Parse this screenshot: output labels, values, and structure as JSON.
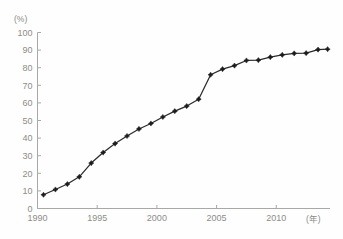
{
  "chart_data": {
    "type": "line",
    "title": "",
    "subtitle": "",
    "xlabel": "(年)",
    "ylabel": "(%)",
    "xlim": [
      1990,
      2014.5
    ],
    "ylim": [
      0,
      100
    ],
    "grid": false,
    "legend": "none",
    "x_tick_labels": [
      "1990",
      "1995",
      "2000",
      "2005",
      "2010"
    ],
    "x_tick_values": [
      1990,
      1995,
      2000,
      2005,
      2010
    ],
    "y_tick_labels": [
      "0",
      "10",
      "20",
      "30",
      "40",
      "50",
      "60",
      "70",
      "80",
      "90",
      "100"
    ],
    "y_tick_values": [
      0,
      10,
      20,
      30,
      40,
      50,
      60,
      70,
      80,
      90,
      100
    ],
    "x": [
      1990.5,
      1991.5,
      1992.5,
      1993.5,
      1994.5,
      1995.5,
      1996.5,
      1997.5,
      1998.5,
      1999.5,
      2000.5,
      2001.5,
      2002.5,
      2003.5,
      2004.5,
      2005.5,
      2006.5,
      2007.5,
      2008.5,
      2009.5,
      2010.5,
      2011.5,
      2012.5,
      2013.5,
      2014.3
    ],
    "values": [
      7.8,
      10.8,
      13.9,
      18.0,
      25.8,
      31.8,
      36.9,
      41.2,
      45.2,
      48.3,
      52.0,
      55.3,
      58.2,
      62.1,
      76.0,
      79.2,
      81.2,
      84.1,
      84.3,
      86.0,
      87.3,
      88.1,
      88.3,
      90.3,
      90.5
    ],
    "annotations": []
  },
  "chart": {
    "y_unit_label": "(%)",
    "x_unit_label": "(年)"
  }
}
